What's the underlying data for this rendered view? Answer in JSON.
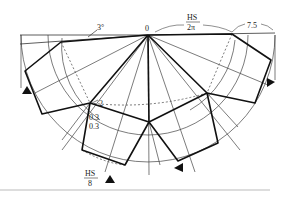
{
  "diagram": {
    "type": "folded-polygon-geometry",
    "labels": {
      "apex": "0",
      "angle": "3°",
      "hs_num": "HS",
      "hs_den_2pi": "2π",
      "right_len": "7.5",
      "node_label": "2",
      "offset_a": "0.3",
      "offset_b": "0.3",
      "hs_bottom_num": "HS",
      "hs_bottom_den": "8"
    },
    "colors": {
      "line": "#222222",
      "thin": "#444444",
      "rule": "#bbbbbb"
    }
  }
}
